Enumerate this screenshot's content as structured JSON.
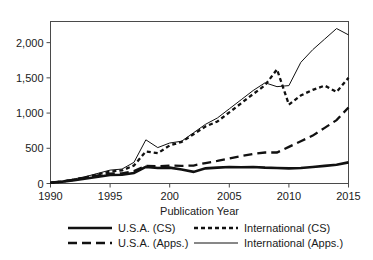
{
  "chart_data": {
    "type": "line",
    "title": "",
    "xlabel": "Publication Year",
    "ylabel": "",
    "xlim": [
      1990,
      2015
    ],
    "ylim": [
      0,
      2300
    ],
    "grid": false,
    "legend_position": "bottom",
    "xticks": [
      1990,
      1995,
      200,
      2005,
      2010,
      2015
    ],
    "xtick_labels": [
      "1990",
      "1995",
      "200",
      "2005",
      "2010",
      "2015"
    ],
    "xtick_values": [
      1990,
      1995,
      2000,
      2005,
      2010,
      2015
    ],
    "yticks": [
      0,
      500,
      1000,
      1500,
      2000
    ],
    "ytick_labels": [
      "0",
      "500",
      "1,000",
      "1,500",
      "2,000"
    ],
    "x": [
      1990,
      1991,
      1992,
      1993,
      1994,
      1995,
      1996,
      1997,
      1998,
      1999,
      2000,
      2001,
      2002,
      2003,
      2004,
      2005,
      2006,
      2007,
      2008,
      2009,
      2010,
      2011,
      2012,
      2013,
      2014,
      2015
    ],
    "series": [
      {
        "name": "U.S.A. (CS)",
        "style": "solid-thick",
        "values": [
          10,
          25,
          45,
          70,
          95,
          120,
          125,
          150,
          235,
          220,
          225,
          200,
          165,
          215,
          225,
          235,
          230,
          235,
          225,
          220,
          215,
          220,
          235,
          250,
          265,
          300
        ]
      },
      {
        "name": "U.S.A. (Apps.)",
        "style": "long-dash",
        "values": [
          12,
          30,
          55,
          85,
          115,
          140,
          145,
          175,
          250,
          245,
          255,
          250,
          255,
          290,
          320,
          355,
          390,
          420,
          440,
          440,
          520,
          600,
          680,
          790,
          900,
          1080
        ]
      },
      {
        "name": "International (CS)",
        "style": "short-dash-thick",
        "values": [
          10,
          28,
          55,
          90,
          130,
          170,
          185,
          255,
          455,
          430,
          540,
          590,
          700,
          810,
          880,
          1010,
          1140,
          1270,
          1395,
          1620,
          1120,
          1250,
          1330,
          1390,
          1300,
          1500
        ]
      },
      {
        "name": "International (Apps.)",
        "style": "solid-thin",
        "values": [
          14,
          35,
          65,
          100,
          145,
          190,
          205,
          300,
          620,
          510,
          575,
          600,
          720,
          840,
          930,
          1060,
          1190,
          1320,
          1430,
          1375,
          1390,
          1720,
          1900,
          2050,
          2200,
          2110
        ]
      }
    ]
  },
  "legend": {
    "entries": [
      {
        "label": "U.S.A. (CS)",
        "style": "solid-thick"
      },
      {
        "label": "International (CS)",
        "style": "short-dash-thick"
      },
      {
        "label": "U.S.A. (Apps.)",
        "style": "long-dash"
      },
      {
        "label": "International (Apps.)",
        "style": "solid-thin"
      }
    ]
  },
  "colors": {
    "line": "#111111",
    "axis": "#4a4a4a",
    "text": "#1a1a1a",
    "background": "#ffffff"
  }
}
